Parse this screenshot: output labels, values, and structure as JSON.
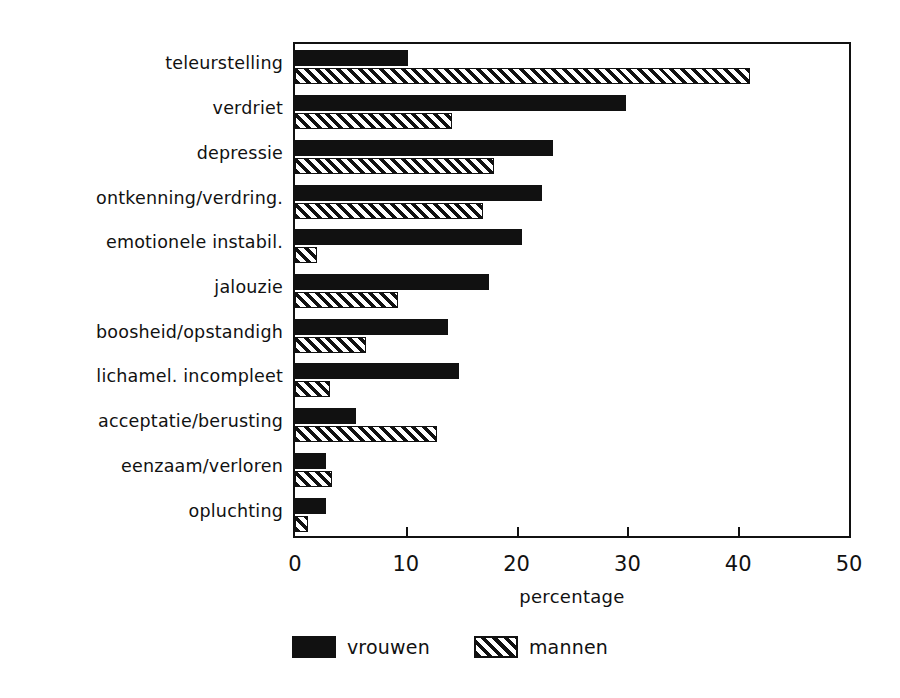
{
  "chart_data": {
    "type": "bar",
    "orientation": "horizontal",
    "title": "",
    "subtitle": "",
    "xlabel": "percentage",
    "ylabel": "",
    "xlim": [
      0,
      50
    ],
    "xticks": [
      0,
      10,
      20,
      30,
      40,
      50
    ],
    "xtick_labels": [
      "0",
      "10",
      "20",
      "30",
      "40",
      "50"
    ],
    "grid": false,
    "legend_position": "bottom-center",
    "categories": [
      "teleurstelling",
      "verdriet",
      "depressie",
      "ontkenning/verdring.",
      "emotionele instabil.",
      "jalouzie",
      "boosheid/opstandigh",
      "lichamel. incompleet",
      "acceptatie/berusting",
      "eenzaam/verloren",
      "opluchting"
    ],
    "series": [
      {
        "name": "vrouwen",
        "fill": "solid",
        "color": "#111111",
        "values": [
          10.2,
          29.9,
          23.3,
          22.3,
          20.5,
          17.5,
          13.8,
          14.8,
          5.5,
          2.8,
          2.8
        ]
      },
      {
        "name": "mannen",
        "fill": "hatched",
        "color": "#111111",
        "values": [
          41.1,
          14.2,
          18.0,
          17.0,
          2.0,
          9.3,
          6.4,
          3.2,
          12.8,
          3.3,
          1.2
        ]
      }
    ]
  },
  "legend": {
    "items": [
      {
        "label": "vrouwen",
        "fill": "solid"
      },
      {
        "label": "mannen",
        "fill": "hatched"
      }
    ]
  },
  "axis": {
    "x_title": "percentage"
  },
  "colors": {
    "ink": "#111111",
    "paper": "#ffffff"
  }
}
